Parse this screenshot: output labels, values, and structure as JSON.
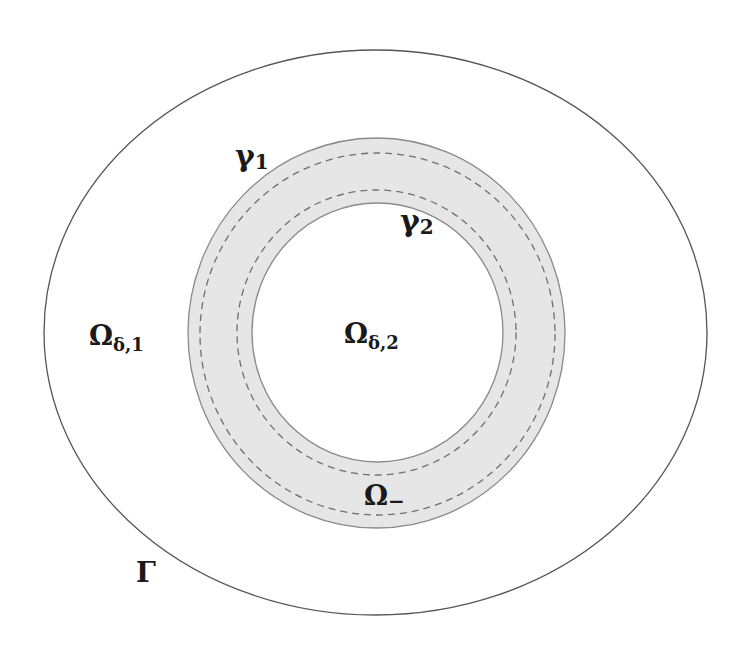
{
  "diagram": {
    "type": "nested-domains",
    "colors": {
      "background": "#ffffff",
      "outer_boundary_stroke": "#555555",
      "annulus_fill": "#e6e6e6",
      "annulus_edge_stroke": "#8a8a8a",
      "dashed_curve_stroke": "#707070",
      "label_color": "#1a1a1a"
    },
    "shapes": {
      "outer_boundary": {
        "cx": 375.5,
        "cy": 332.5,
        "rx": 331.5,
        "ry": 282.5
      },
      "annulus_outer_edge": {
        "cx": 376.5,
        "cy": 333,
        "rx": 188.5,
        "ry": 195
      },
      "gamma1_curve": {
        "cx": 377.5,
        "cy": 334,
        "rx": 177.5,
        "ry": 181
      },
      "gamma2_curve": {
        "cx": 376.5,
        "cy": 332.5,
        "rx": 139.5,
        "ry": 142.5
      },
      "annulus_inner_edge": {
        "cx": 377.5,
        "cy": 332.5,
        "rx": 125.5,
        "ry": 129.5
      }
    },
    "labels": {
      "gamma1": {
        "main": "γ",
        "sub": "1"
      },
      "gamma2": {
        "main": "γ",
        "sub": "2"
      },
      "omega_delta1": {
        "main": "Ω",
        "sub": "δ,1"
      },
      "omega_delta2": {
        "main": "Ω",
        "sub": "δ,2"
      },
      "omega_minus": {
        "main": "Ω",
        "sub": "−"
      },
      "Gamma": {
        "main": "Γ"
      }
    }
  }
}
